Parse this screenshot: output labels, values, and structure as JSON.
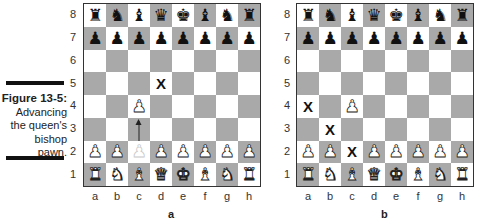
{
  "figure": {
    "number": "Figure 13-5:",
    "caption_lines": [
      "Advancing",
      "the queen's",
      "bishop",
      "pawn."
    ]
  },
  "rank_labels": [
    "8",
    "7",
    "6",
    "5",
    "4",
    "3",
    "2",
    "1"
  ],
  "file_labels": [
    "a",
    "b",
    "c",
    "d",
    "e",
    "f",
    "g",
    "h"
  ],
  "colors": {
    "light_square": "#ffffff",
    "dark_square": "#a9a9a9",
    "border": "#333333"
  },
  "boards": [
    {
      "label": "a",
      "rows": [
        [
          "bR",
          "bN",
          "bB",
          "bQ",
          "bK",
          "bB",
          "bN",
          "bR"
        ],
        [
          "bP",
          "bP",
          "bP",
          "bP",
          "bP",
          "bP",
          "bP",
          "bP"
        ],
        [
          "",
          "",
          "",
          "",
          "",
          "",
          "",
          ""
        ],
        [
          "",
          "",
          "",
          "X",
          "",
          "",
          "",
          ""
        ],
        [
          "",
          "",
          "wP",
          "",
          "",
          "",
          "",
          ""
        ],
        [
          "",
          "",
          "arrow",
          "",
          "",
          "",
          "",
          ""
        ],
        [
          "wP",
          "wP",
          "wPfaded",
          "wP",
          "wP",
          "wP",
          "wP",
          "wP"
        ],
        [
          "wR",
          "wN",
          "wB",
          "wQ",
          "wK",
          "wB",
          "wN",
          "wR"
        ]
      ]
    },
    {
      "label": "b",
      "rows": [
        [
          "bR",
          "bN",
          "bB",
          "bQ",
          "bK",
          "bB",
          "bN",
          "bR"
        ],
        [
          "bP",
          "bP",
          "bP",
          "bP",
          "bP",
          "bP",
          "bP",
          "bP"
        ],
        [
          "",
          "",
          "",
          "",
          "",
          "",
          "",
          ""
        ],
        [
          "",
          "",
          "",
          "",
          "",
          "",
          "",
          ""
        ],
        [
          "X",
          "",
          "wP",
          "",
          "",
          "",
          "",
          ""
        ],
        [
          "",
          "X",
          "",
          "",
          "",
          "",
          "",
          ""
        ],
        [
          "wP",
          "wP",
          "X",
          "wP",
          "wP",
          "wP",
          "wP",
          "wP"
        ],
        [
          "wR",
          "wN",
          "wB",
          "wQ",
          "wK",
          "wB",
          "wN",
          "wR"
        ]
      ]
    }
  ]
}
